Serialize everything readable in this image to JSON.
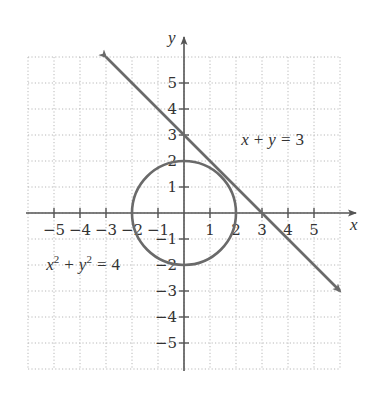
{
  "chart_data": {
    "type": "line",
    "title": "",
    "xlabel": "x",
    "ylabel": "y",
    "xlim": [
      -6,
      6
    ],
    "ylim": [
      -6,
      6
    ],
    "grid": true,
    "x_ticks": [
      -5,
      -4,
      -3,
      -2,
      -1,
      1,
      2,
      3,
      4,
      5
    ],
    "y_ticks": [
      5,
      4,
      3,
      2,
      1,
      -1,
      -2,
      -3,
      -4,
      -5
    ],
    "x_tick_labels": [
      "−5",
      "−4",
      "−3",
      "−2",
      "−1",
      "1",
      "2",
      "3",
      "4",
      "5"
    ],
    "y_tick_labels": [
      "5",
      "4",
      "3",
      "2",
      "1",
      "−1",
      "−2",
      "−3",
      "−4",
      "−5"
    ],
    "series": [
      {
        "name": "x + y = 3",
        "kind": "line",
        "equation": "x + y = 3",
        "x": [
          -3,
          6
        ],
        "y": [
          6,
          -3
        ],
        "arrows": "both"
      },
      {
        "name": "x² + y² = 4",
        "kind": "circle",
        "equation": "x^2 + y^2 = 4",
        "center": [
          0,
          0
        ],
        "radius": 2
      }
    ],
    "annotations": [
      {
        "text": "x + y = 3",
        "at": [
          2.2,
          2.6
        ]
      },
      {
        "text": "x² + y² = 4",
        "at": [
          -5.3,
          -2.2
        ]
      }
    ]
  },
  "labels": {
    "x_axis": "x",
    "y_axis": "y",
    "line_eq": {
      "a": "x",
      "plus": "+",
      "b": "y",
      "eq": "=",
      "c": "3"
    },
    "circle_eq": {
      "a": "x",
      "a_exp": "2",
      "plus": "+",
      "b": "y",
      "b_exp": "2",
      "eq": "=",
      "c": "4"
    }
  },
  "colors": {
    "curve": "#6a6a6a",
    "axis": "#555555",
    "grid": "#b8b8b8"
  }
}
